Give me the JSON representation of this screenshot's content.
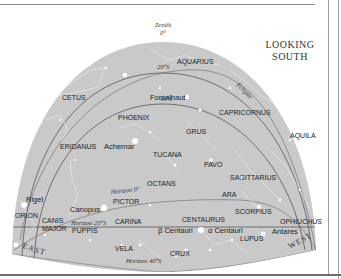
{
  "chart": {
    "title_line1": "LOOKING",
    "title_line2": "SOUTH",
    "zenith": {
      "label": "Zenith",
      "degree": "0°"
    },
    "directions": {
      "east": "EAST",
      "west": "WEST"
    },
    "arcs": {
      "dec_20s": "20°S",
      "dec_40s": "40°S",
      "ecliptic": "Ecliptic",
      "horizon_0": "Horizon 0°",
      "horizon_20s": "Horizon 20°S",
      "horizon_40s": "Horizon 40°S"
    },
    "constellations": [
      {
        "name": "AQUARIUS"
      },
      {
        "name": "CETUS"
      },
      {
        "name": "CAPRICORNUS"
      },
      {
        "name": "PHOENIX"
      },
      {
        "name": "GRUS"
      },
      {
        "name": "AQUILA"
      },
      {
        "name": "ERIDANUS"
      },
      {
        "name": "TUCANA"
      },
      {
        "name": "PAVO"
      },
      {
        "name": "SAGITTARIUS"
      },
      {
        "name": "OCTANS"
      },
      {
        "name": "ARA"
      },
      {
        "name": "PICTOR"
      },
      {
        "name": "SCORPIUS"
      },
      {
        "name": "ORION"
      },
      {
        "name": "CANIS"
      },
      {
        "name": "MAJOR"
      },
      {
        "name": "CARINA"
      },
      {
        "name": "CENTAURUS"
      },
      {
        "name": "OPHIUCHUS"
      },
      {
        "name": "PUPPIS"
      },
      {
        "name": "LUPUS"
      },
      {
        "name": "VELA"
      },
      {
        "name": "CRUX"
      }
    ],
    "stars": [
      {
        "name": "Fomalhaut"
      },
      {
        "name": "Achernar"
      },
      {
        "name": "Rigel"
      },
      {
        "name": "Canopus"
      },
      {
        "name": "β Centauri"
      },
      {
        "name": "α Centauri"
      },
      {
        "name": "Antares"
      }
    ],
    "colors": {
      "sky": "#c9c9c9",
      "lines": "#555555",
      "stars": "#ffffff",
      "text": "#222222"
    }
  }
}
